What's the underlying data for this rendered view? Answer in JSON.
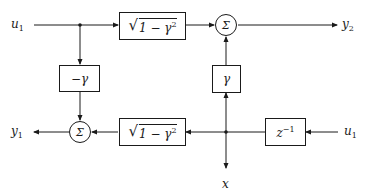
{
  "diagram": {
    "inputs": {
      "top_left": {
        "symbol": "u",
        "subscript": "1"
      },
      "bottom_right": {
        "symbol": "u",
        "subscript": "1"
      }
    },
    "outputs": {
      "top_right": {
        "symbol": "y",
        "subscript": "2"
      },
      "bottom_left": {
        "symbol": "y",
        "subscript": "1"
      },
      "bottom_center": {
        "symbol": "x"
      }
    },
    "blocks": {
      "top_gain": {
        "radical": "√",
        "radicand": "1 − γ",
        "power": "2"
      },
      "bottom_gain": {
        "radical": "√",
        "radicand": "1 − γ",
        "power": "2"
      },
      "neg_gamma": {
        "label": "−γ"
      },
      "gamma": {
        "label": "γ"
      },
      "delay": {
        "base": "z",
        "power": "−1"
      }
    },
    "summers": {
      "top": {
        "label": "Σ"
      },
      "bottom": {
        "label": "Σ"
      }
    }
  }
}
